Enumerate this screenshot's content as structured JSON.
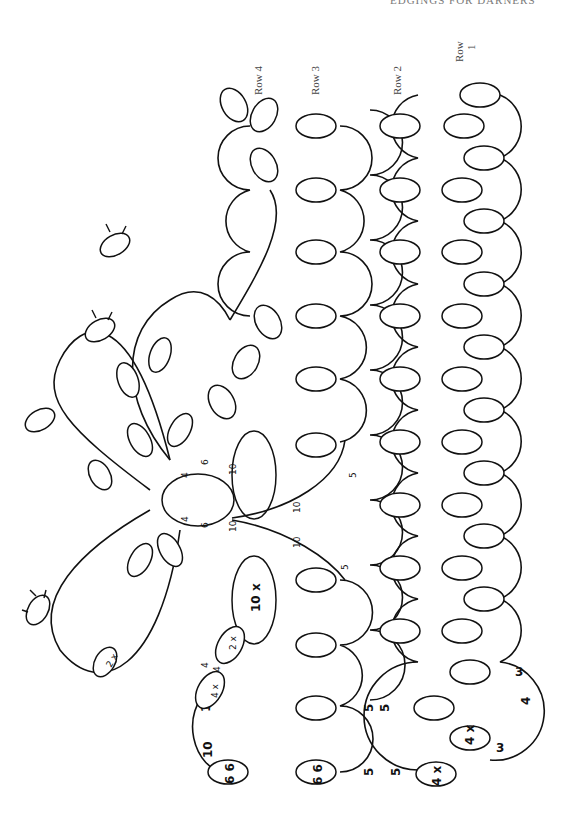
{
  "page": {
    "header_text": "EDGINGS FOR DARNERS",
    "orientation": "rotated 90deg counter-clockwise"
  },
  "diagram": {
    "type": "tatting pattern",
    "row_labels": [
      {
        "id": "row4",
        "text": "Row 4"
      },
      {
        "id": "row3",
        "text": "Row 3"
      },
      {
        "id": "row2",
        "text": "Row 2"
      },
      {
        "id": "row1_a",
        "text": "Row"
      },
      {
        "id": "row1_b",
        "text": "1"
      }
    ],
    "stitch_counts": {
      "row1_chain_top": "3",
      "row1_chain_mid": "4",
      "row1_chain_bottom": "3",
      "row1_ring": "4 x",
      "row2_ring": "4 x",
      "row2_chain_a": "5",
      "row2_chain_b": "5",
      "row2_chain_c": "5",
      "row2_chain_d": "5",
      "row3_ring": "6 6",
      "row4_ring": "6 6",
      "row4_chain_a": "10",
      "row4_chain_b": "10",
      "flower_ring_small": "4 x",
      "flower_ring_picots": "2 x",
      "flower_ring_a": "4",
      "flower_ring_b": "4",
      "loose_ring": "2 x",
      "large_ring": "10 x",
      "center_ring_6a": "6",
      "center_ring_6b": "6",
      "center_ring_4a": "4",
      "center_ring_4b": "4",
      "center_ring_10a": "10",
      "center_ring_10b": "10",
      "center_chain_10a": "10",
      "center_chain_10b": "10",
      "center_chain_5a": "5",
      "center_chain_5b": "5"
    }
  }
}
